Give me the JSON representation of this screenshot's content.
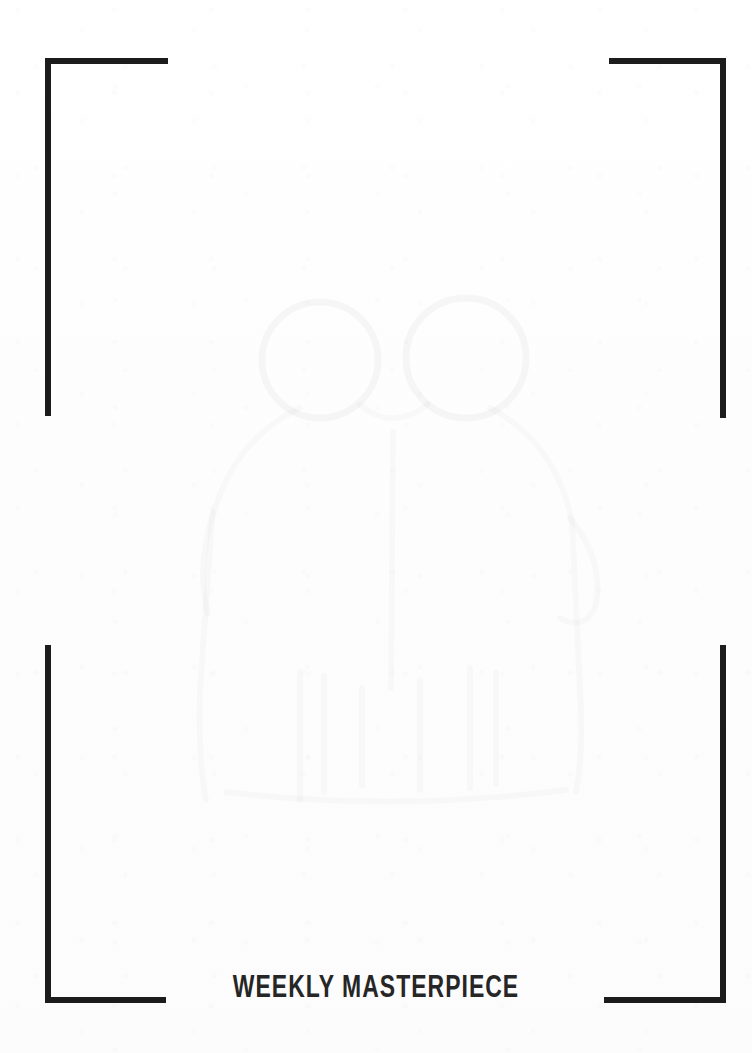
{
  "page": {
    "width": 752,
    "height": 1053,
    "background_color": "#fdfdfd",
    "ink_color": "#1c1c1c"
  },
  "caption": {
    "text": "WEEKLY MASTERPIECE",
    "color": "#262626"
  },
  "frame": {
    "style": "corner-crop-brackets",
    "stroke_color": "#1c1c1c",
    "stroke_width_px": 6,
    "corners": [
      {
        "name": "top-left",
        "label": "top left crop bracket"
      },
      {
        "name": "top-right",
        "label": "top right crop bracket"
      },
      {
        "name": "bottom-left",
        "label": "bottom left crop bracket"
      },
      {
        "name": "bottom-right",
        "label": "bottom right crop bracket"
      }
    ]
  },
  "watermark": {
    "description": "faint ghosted line drawing of a two-headed figure",
    "opacity": "0.03",
    "stroke_color": "#000000"
  }
}
